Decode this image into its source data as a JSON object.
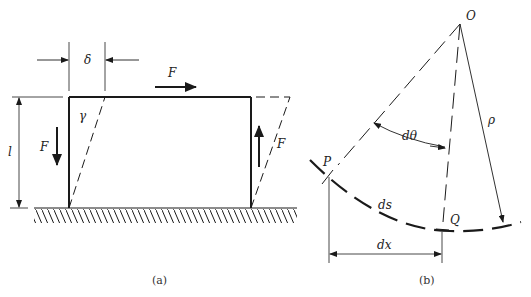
{
  "figure_a": {
    "caption": "(a)",
    "labels": {
      "delta": "δ",
      "force_top": "F",
      "force_left": "F",
      "force_right": "F",
      "gamma": "γ",
      "length": "l"
    }
  },
  "figure_b": {
    "caption": "(b)",
    "labels": {
      "origin": "O",
      "rho": "ρ",
      "dtheta": "dθ",
      "point_p": "P",
      "point_q": "Q",
      "ds": "ds",
      "dx": "dx"
    }
  },
  "colors": {
    "ink": "#1a1a1a",
    "background": "#ffffff"
  }
}
